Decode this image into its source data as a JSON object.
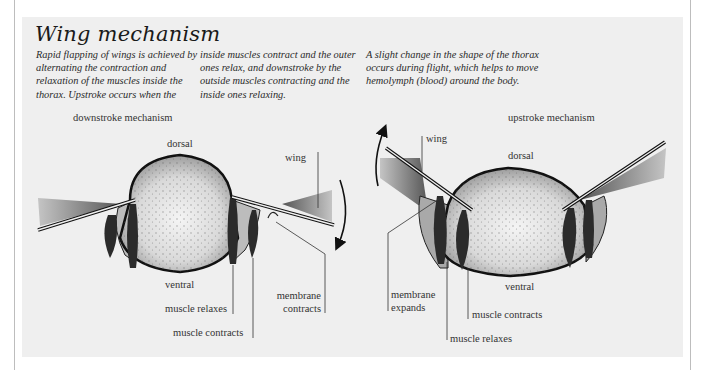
{
  "title": "Wing mechanism",
  "intro": {
    "col1": "Rapid flapping of wings is achieved by alternating the contraction and relaxation of the muscles inside the thorax. Upstroke occurs when the",
    "col2": "inside muscles contract and the outer ones relax, and downstroke by the outside muscles contracting and the inside ones relaxing.",
    "col3": "A slight change in the shape of the thorax occurs during flight, which helps to move hemolymph (blood) around the body."
  },
  "downstroke": {
    "heading": "downstroke mechanism",
    "labels": {
      "dorsal": "dorsal",
      "ventral": "ventral",
      "wing": "wing",
      "muscle_relaxes": "muscle relaxes",
      "muscle_contracts": "muscle contracts",
      "membrane_line1": "membrane",
      "membrane_line2": "contracts"
    },
    "arrow_direction": "down"
  },
  "upstroke": {
    "heading": "upstroke mechanism",
    "labels": {
      "dorsal": "dorsal",
      "ventral": "ventral",
      "wing": "wing",
      "muscle_relaxes": "muscle relaxes",
      "muscle_contracts": "muscle contracts",
      "membrane_line1": "membrane",
      "membrane_line2": "expands"
    },
    "arrow_direction": "up"
  },
  "colors": {
    "background": "#ffffff",
    "panel": "#efefef",
    "outline": "#1a1a1a",
    "muscle": "#2b2b2b",
    "body_fill": "#cfcfcf"
  }
}
